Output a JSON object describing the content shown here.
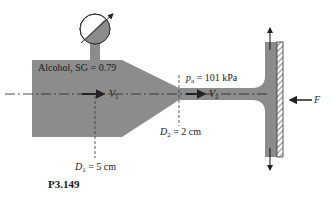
{
  "figure": {
    "id": "P3.149",
    "fluid_label": "Alcohol, SG = 0.79",
    "ambient_pressure": {
      "symbol": "p",
      "subscript": "a",
      "value": "= 101 kPa"
    },
    "inlet_velocity": {
      "symbol": "V",
      "subscript": "1"
    },
    "jet_velocity": {
      "symbol": "V",
      "subscript": "2"
    },
    "inlet_diameter": {
      "symbol": "D",
      "subscript": "1",
      "value": "= 5 cm"
    },
    "jet_diameter": {
      "symbol": "D",
      "subscript": "2",
      "value": "= 2 cm"
    },
    "force": {
      "symbol": "F"
    }
  },
  "colors": {
    "fluid": "#8c8c8c",
    "outline": "#333333",
    "text": "#1a1a1a",
    "background": "#ffffff"
  }
}
